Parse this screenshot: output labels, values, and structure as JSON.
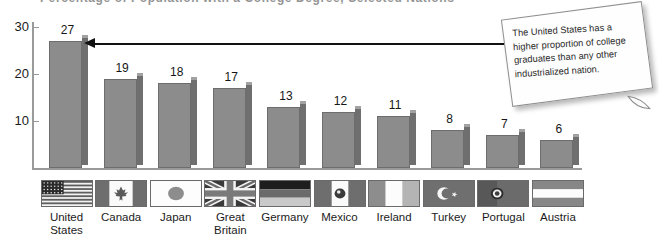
{
  "title_partial": "Percentage of Population with a College Degree, Selected Nations",
  "chart_data": {
    "type": "bar",
    "title": "Percentage of Population with a College Degree, Selected Nations",
    "xlabel": "",
    "ylabel": "",
    "ylim": [
      0,
      30
    ],
    "yticks": [
      10,
      20,
      30
    ],
    "grid": false,
    "legend": "none",
    "categories": [
      "United States",
      "Canada",
      "Japan",
      "Great Britain",
      "Germany",
      "Mexico",
      "Ireland",
      "Turkey",
      "Portugal",
      "Austria"
    ],
    "values": [
      27,
      19,
      18,
      17,
      13,
      12,
      11,
      8,
      7,
      6
    ],
    "bar_color": "#8c8c8c",
    "bar_side_color": "#6f6f6f",
    "bar_top_color": "#a2a2a2",
    "annotations": [
      {
        "text": "The United States has a higher proportion of college graduates than any other industrialized nation.",
        "points_to": "United States"
      }
    ]
  },
  "y_axis": {
    "ticks": [
      {
        "label": "30",
        "value": 30
      },
      {
        "label": "20",
        "value": 20
      },
      {
        "label": "10",
        "value": 10
      }
    ]
  },
  "bars": [
    {
      "country": "United States",
      "label_line1": "United",
      "label_line2": "States",
      "value": 27,
      "value_label": "27",
      "flag": "flag-united-states"
    },
    {
      "country": "Canada",
      "label_line1": "Canada",
      "label_line2": "",
      "value": 19,
      "value_label": "19",
      "flag": "flag-canada"
    },
    {
      "country": "Japan",
      "label_line1": "Japan",
      "label_line2": "",
      "value": 18,
      "value_label": "18",
      "flag": "flag-japan"
    },
    {
      "country": "Great Britain",
      "label_line1": "Great",
      "label_line2": "Britain",
      "value": 17,
      "value_label": "17",
      "flag": "flag-great-britain"
    },
    {
      "country": "Germany",
      "label_line1": "Germany",
      "label_line2": "",
      "value": 13,
      "value_label": "13",
      "flag": "flag-germany"
    },
    {
      "country": "Mexico",
      "label_line1": "Mexico",
      "label_line2": "",
      "value": 12,
      "value_label": "12",
      "flag": "flag-mexico"
    },
    {
      "country": "Ireland",
      "label_line1": "Ireland",
      "label_line2": "",
      "value": 11,
      "value_label": "11",
      "flag": "flag-ireland"
    },
    {
      "country": "Turkey",
      "label_line1": "Turkey",
      "label_line2": "",
      "value": 8,
      "value_label": "8",
      "flag": "flag-turkey"
    },
    {
      "country": "Portugal",
      "label_line1": "Portugal",
      "label_line2": "",
      "value": 7,
      "value_label": "7",
      "flag": "flag-portugal"
    },
    {
      "country": "Austria",
      "label_line1": "Austria",
      "label_line2": "",
      "value": 6,
      "value_label": "6",
      "flag": "flag-austria"
    }
  ],
  "callout": {
    "text": "The United States has a higher proportion of college graduates than any other industrialized nation."
  }
}
